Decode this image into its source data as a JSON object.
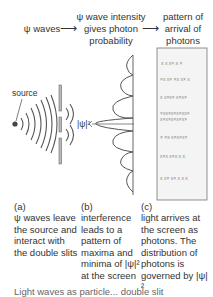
{
  "header": {
    "col_a": "ψ waves",
    "col_b": "ψ wave intensity gives photon probability",
    "col_c": "pattern of arrival of photons",
    "arrow": "⟶"
  },
  "diagram": {
    "source_label": "source",
    "intensity_label": "|ψ|²"
  },
  "captions": {
    "a": {
      "tag": "(a)",
      "text": "ψ waves leave the source and interact with the double slits"
    },
    "b": {
      "tag": "(b)",
      "text": "interference leads to a pattern of maxima and minima of |ψ|² at the screen"
    },
    "c": {
      "tag": "(c)",
      "text": "light arrives at the screen as photons. The distribution of photons is governed by |ψ|²"
    }
  },
  "footer_cut": "Light waves as particle... double slit"
}
